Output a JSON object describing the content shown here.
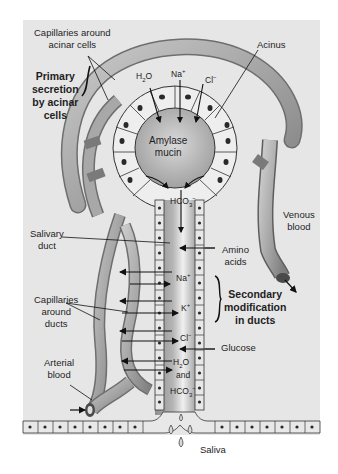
{
  "diagram": {
    "labels": {
      "capillaries_acinar": [
        "Capillaries around",
        "acinar cells"
      ],
      "primary_secretion": [
        "Primary",
        "secretion",
        "by acinar",
        "cells"
      ],
      "acinus": "Acinus",
      "amylase": "Amylase",
      "mucin": "mucin",
      "venous_blood": [
        "Venous",
        "blood"
      ],
      "salivary_duct": [
        "Salivary",
        "duct"
      ],
      "capillaries_ducts": [
        "Capillaries",
        "around",
        "ducts"
      ],
      "arterial_blood": [
        "Arterial",
        "blood"
      ],
      "amino_acids": [
        "Amino",
        "acids"
      ],
      "secondary_modification": [
        "Secondary",
        "modification",
        "in ducts"
      ],
      "glucose": "Glucose",
      "saliva": "Saliva"
    },
    "ions": {
      "h2o_top": {
        "base": "H",
        "sub": "2",
        "rest": "O"
      },
      "na_top": {
        "base": "Na",
        "sup": "+"
      },
      "cl_top": {
        "base": "Cl",
        "sup": "−"
      },
      "hco3_top": {
        "base": "HCO",
        "sub": "3",
        "sup": "−"
      },
      "na_duct": {
        "base": "Na",
        "sup": "+"
      },
      "k_duct": {
        "base": "K",
        "sup": "+"
      },
      "cl_duct": {
        "base": "Cl",
        "sup": "−"
      },
      "h2o_duct": {
        "base": "H",
        "sub": "2",
        "rest": "O"
      },
      "and": "and",
      "hco3_duct": {
        "base": "HCO",
        "sub": "3",
        "sup": "−"
      }
    },
    "colors": {
      "panel_bg": "#e6e6e6",
      "vessel": "#9a9a9a",
      "vessel_highlight": "#c8c8c8",
      "cell_fill": "#ececec",
      "lumen": "#b8b8b8",
      "nucleus": "#2a2a2a"
    }
  }
}
